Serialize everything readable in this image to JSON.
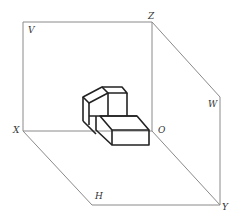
{
  "diagram": {
    "planes": {
      "V": "V",
      "H": "H",
      "W": "W"
    },
    "axes": {
      "X": "X",
      "Y": "Y",
      "Z": "Z",
      "O": "O"
    },
    "colors": {
      "frame": "#8a8a8a",
      "object": "#222222",
      "label": "#333333",
      "background": "#ffffff"
    }
  }
}
